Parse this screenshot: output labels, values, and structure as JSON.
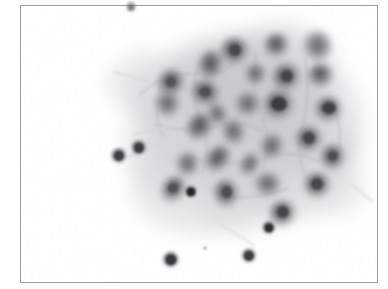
{
  "figure": {
    "kind": "micrograph",
    "modality": "light-microscopy-cytology",
    "stain_appearance": "grayscale",
    "caption": "",
    "background_color": "#ffffff",
    "frame_color": "#9b9b9b",
    "frame": {
      "x": 20,
      "y": 5,
      "width": 358,
      "height": 278
    },
    "canvas": {
      "width": 356,
      "height": 276
    },
    "tone": {
      "background": "#ffffff",
      "cytoplasm_light": "#e3e3e3",
      "cytoplasm_mid": "#c9c9ca",
      "cytoplasm_dark": "#b0b0b2",
      "nucleus_mid": "#8e8e91",
      "nucleus_dark": "#6d6d70",
      "nucleus_darkest": "#4a4a4d",
      "chromatin_core": "#343437"
    },
    "content": {
      "cluster": {
        "label": "epithelial-cell-cluster",
        "center_x": 205,
        "center_y": 125,
        "radius_x": 118,
        "radius_y": 105,
        "opacity": 0.95
      },
      "cytoplasm_blobs": [
        {
          "cx": 205,
          "cy": 122,
          "rx": 112,
          "ry": 100,
          "rot": 12,
          "tone": "#d7d7d8",
          "blur": 9,
          "opacity": 0.9
        },
        {
          "cx": 215,
          "cy": 108,
          "rx": 92,
          "ry": 80,
          "rot": -8,
          "tone": "#cbcbcd",
          "blur": 8,
          "opacity": 0.8
        },
        {
          "cx": 160,
          "cy": 96,
          "rx": 56,
          "ry": 44,
          "rot": 28,
          "tone": "#d2d2d4",
          "blur": 8,
          "opacity": 0.75
        },
        {
          "cx": 120,
          "cy": 84,
          "rx": 34,
          "ry": 26,
          "rot": 35,
          "tone": "#dedee0",
          "blur": 7,
          "opacity": 0.7
        },
        {
          "cx": 250,
          "cy": 72,
          "rx": 66,
          "ry": 52,
          "rot": -16,
          "tone": "#c6c6c9",
          "blur": 8,
          "opacity": 0.8
        },
        {
          "cx": 265,
          "cy": 150,
          "rx": 72,
          "ry": 62,
          "rot": 8,
          "tone": "#cdcdd0",
          "blur": 9,
          "opacity": 0.78
        },
        {
          "cx": 185,
          "cy": 175,
          "rx": 74,
          "ry": 52,
          "rot": -6,
          "tone": "#d5d5d7",
          "blur": 9,
          "opacity": 0.74
        },
        {
          "cx": 300,
          "cy": 120,
          "rx": 42,
          "ry": 58,
          "rot": 6,
          "tone": "#cfcfd2",
          "blur": 8,
          "opacity": 0.72
        },
        {
          "cx": 150,
          "cy": 150,
          "rx": 48,
          "ry": 42,
          "rot": 18,
          "tone": "#dcdcde",
          "blur": 8,
          "opacity": 0.68
        },
        {
          "cx": 230,
          "cy": 196,
          "rx": 52,
          "ry": 30,
          "rot": -10,
          "tone": "#d9d9db",
          "blur": 9,
          "opacity": 0.66
        }
      ],
      "nuclei_in_cluster": [
        {
          "cx": 150,
          "cy": 78,
          "rx": 14,
          "ry": 15,
          "rot": 20,
          "core": "#5b5b5e",
          "ring": "#8f8f93"
        },
        {
          "cx": 146,
          "cy": 98,
          "rx": 13,
          "ry": 14,
          "rot": -10,
          "core": "#626265",
          "ring": "#949498"
        },
        {
          "cx": 190,
          "cy": 60,
          "rx": 13,
          "ry": 16,
          "rot": 8,
          "core": "#5f5f63",
          "ring": "#909094"
        },
        {
          "cx": 184,
          "cy": 88,
          "rx": 15,
          "ry": 14,
          "rot": 28,
          "core": "#58585b",
          "ring": "#8b8b8f"
        },
        {
          "cx": 214,
          "cy": 46,
          "rx": 15,
          "ry": 15,
          "rot": -4,
          "core": "#4f4f52",
          "ring": "#858589"
        },
        {
          "cx": 226,
          "cy": 98,
          "rx": 13,
          "ry": 13,
          "rot": 14,
          "core": "#6a6a6e",
          "ring": "#9b9b9f"
        },
        {
          "cx": 256,
          "cy": 40,
          "rx": 13,
          "ry": 13,
          "rot": 10,
          "core": "#525255",
          "ring": "#8a8a8e"
        },
        {
          "cx": 266,
          "cy": 72,
          "rx": 15,
          "ry": 15,
          "rot": -12,
          "core": "#4b4b4e",
          "ring": "#848488"
        },
        {
          "cx": 258,
          "cy": 100,
          "rx": 16,
          "ry": 16,
          "rot": 6,
          "core": "#3c3c40",
          "ring": "#76767a"
        },
        {
          "cx": 296,
          "cy": 40,
          "rx": 15,
          "ry": 16,
          "rot": 0,
          "core": "#55555a",
          "ring": "#8d8d91"
        },
        {
          "cx": 300,
          "cy": 70,
          "rx": 13,
          "ry": 13,
          "rot": 8,
          "core": "#48484c",
          "ring": "#828286"
        },
        {
          "cx": 308,
          "cy": 104,
          "rx": 14,
          "ry": 14,
          "rot": -8,
          "core": "#414145",
          "ring": "#7d7d82"
        },
        {
          "cx": 288,
          "cy": 134,
          "rx": 14,
          "ry": 14,
          "rot": 12,
          "core": "#46464a",
          "ring": "#808085"
        },
        {
          "cx": 250,
          "cy": 140,
          "rx": 12,
          "ry": 14,
          "rot": 24,
          "core": "#5e5e62",
          "ring": "#949498"
        },
        {
          "cx": 212,
          "cy": 126,
          "rx": 12,
          "ry": 14,
          "rot": -18,
          "core": "#626266",
          "ring": "#96969a"
        },
        {
          "cx": 178,
          "cy": 122,
          "rx": 13,
          "ry": 16,
          "rot": 32,
          "core": "#5a5a5e",
          "ring": "#8e8e92"
        },
        {
          "cx": 196,
          "cy": 154,
          "rx": 12,
          "ry": 16,
          "rot": 38,
          "core": "#5c5c60",
          "ring": "#909094"
        },
        {
          "cx": 166,
          "cy": 158,
          "rx": 12,
          "ry": 13,
          "rot": -6,
          "core": "#636367",
          "ring": "#98989c"
        },
        {
          "cx": 152,
          "cy": 184,
          "rx": 12,
          "ry": 15,
          "rot": 34,
          "core": "#575757",
          "ring": "#8c8c90"
        },
        {
          "cx": 206,
          "cy": 188,
          "rx": 13,
          "ry": 15,
          "rot": -16,
          "core": "#4e4e52",
          "ring": "#868689"
        },
        {
          "cx": 246,
          "cy": 178,
          "rx": 14,
          "ry": 13,
          "rot": 6,
          "core": "#59595d",
          "ring": "#8e8e92"
        },
        {
          "cx": 262,
          "cy": 208,
          "rx": 14,
          "ry": 14,
          "rot": -10,
          "core": "#45454a",
          "ring": "#7f7f84"
        },
        {
          "cx": 296,
          "cy": 180,
          "rx": 14,
          "ry": 14,
          "rot": 14,
          "core": "#4a4a4f",
          "ring": "#838388"
        },
        {
          "cx": 312,
          "cy": 152,
          "rx": 13,
          "ry": 14,
          "rot": -4,
          "core": "#4f4f54",
          "ring": "#87878c"
        },
        {
          "cx": 234,
          "cy": 68,
          "rx": 11,
          "ry": 12,
          "rot": 18,
          "core": "#6d6d72",
          "ring": "#9e9ea2"
        },
        {
          "cx": 196,
          "cy": 108,
          "rx": 10,
          "ry": 12,
          "rot": -22,
          "core": "#69696e",
          "ring": "#9c9ca0"
        },
        {
          "cx": 228,
          "cy": 158,
          "rx": 10,
          "ry": 13,
          "rot": 28,
          "core": "#6b6b70",
          "ring": "#9d9da1"
        }
      ],
      "isolated_nuclei": [
        {
          "cx": 98,
          "cy": 150,
          "r": 8,
          "core": "#4e4e52",
          "label": "free-nucleus-left-upper"
        },
        {
          "cx": 118,
          "cy": 142,
          "r": 8,
          "core": "#4a4a4e",
          "label": "free-nucleus-left-mid"
        },
        {
          "cx": 170,
          "cy": 186,
          "r": 7,
          "core": "#2f2f33",
          "label": "free-nucleus-dark-small"
        },
        {
          "cx": 248,
          "cy": 222,
          "r": 7,
          "core": "#3a3a3e",
          "label": "free-nucleus-below-cluster"
        },
        {
          "cx": 228,
          "cy": 250,
          "r": 8,
          "core": "#4c4c50",
          "label": "free-nucleus-bottom-right"
        },
        {
          "cx": 150,
          "cy": 254,
          "r": 9,
          "core": "#48484c",
          "label": "free-nucleus-bottom-left"
        },
        {
          "cx": 184,
          "cy": 242,
          "r": 2,
          "core": "#8a8a8e",
          "label": "debris-speck"
        }
      ],
      "wisps": [
        {
          "x1": 104,
          "y1": 152,
          "x2": 150,
          "y2": 138,
          "tone": "#dcdcde"
        },
        {
          "x1": 122,
          "y1": 140,
          "x2": 166,
          "y2": 132,
          "tone": "#dedee0"
        },
        {
          "x1": 196,
          "y1": 216,
          "x2": 232,
          "y2": 238,
          "tone": "#e2e2e4"
        },
        {
          "x1": 92,
          "y1": 66,
          "x2": 128,
          "y2": 76,
          "tone": "#e0e0e2"
        },
        {
          "x1": 330,
          "y1": 178,
          "x2": 352,
          "y2": 196,
          "tone": "#e4e4e6"
        }
      ],
      "edge_speck": {
        "x": 126,
        "y": 0,
        "label": "speck-on-top-frame-edge"
      }
    }
  }
}
